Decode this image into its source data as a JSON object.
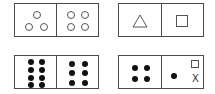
{
  "figures": [
    {
      "id": "top-left",
      "left_cell": {
        "content": "3 hollow circles"
      },
      "right_cell": {
        "content": "4 hollow circles"
      }
    },
    {
      "id": "top-right",
      "left_cell": {
        "content": "triangle"
      },
      "right_cell": {
        "content": "square"
      }
    },
    {
      "id": "bottom-left",
      "left_cell": {
        "content": "8 black dots"
      },
      "right_cell": {
        "content": "6 black dots"
      }
    },
    {
      "id": "bottom-right",
      "left_cell": {
        "content": "4 black dots"
      },
      "right_cell": {
        "content": "1 black dot, small square, unknown"
      },
      "unknown_label": "X"
    }
  ]
}
